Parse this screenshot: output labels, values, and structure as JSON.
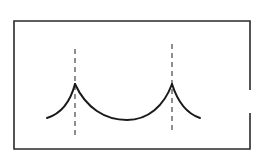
{
  "diagram": {
    "colors": {
      "background": "#ffffff",
      "stroke": "#1a1a1a",
      "frame": "#2a2a2a",
      "dashed": "#333333"
    },
    "frame": {
      "left": 14,
      "top": 21,
      "right": 250,
      "bottom": 149,
      "right_gap": {
        "from_y": 90,
        "to_y": 113
      }
    },
    "cusps": [
      {
        "x": 75,
        "y": 84
      },
      {
        "x": 172,
        "y": 84
      }
    ],
    "dashed_lines": [
      {
        "x": 75,
        "y1": 49,
        "y2": 136
      },
      {
        "x": 172,
        "y1": 44,
        "y2": 133
      }
    ],
    "curve": {
      "start": {
        "x": 47,
        "y": 118
      },
      "trough": {
        "x": 127,
        "y": 120
      },
      "end": {
        "x": 200,
        "y": 118
      }
    }
  }
}
